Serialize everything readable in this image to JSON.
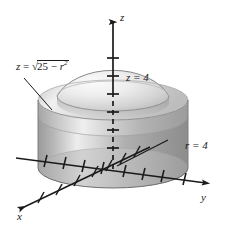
{
  "figure": {
    "background_color": "#ffffff",
    "ink_color": "#1a1a1a",
    "width": 227,
    "height": 231
  },
  "axes": {
    "z": {
      "label": "z",
      "direction": "up",
      "arrow": true
    },
    "y": {
      "label": "y",
      "direction": "right",
      "arrow": true
    },
    "x": {
      "label": "x",
      "direction": "down-left",
      "arrow": true
    },
    "tick_marks": true
  },
  "annotations": {
    "surface": {
      "name": "sphere-equation",
      "prefix": "z",
      "equals": "=",
      "radical_sign": "√",
      "radicand_lead": "25",
      "minus": "−",
      "radicand_var": "r",
      "radicand_exp": "2",
      "plain_text": "z = √(25 − r²)"
    },
    "plane": {
      "name": "plane-equation",
      "text": "z = 4"
    },
    "cylinder": {
      "name": "cylinder-equation",
      "text": "r = 4"
    }
  },
  "solid": {
    "description": "Shaded gray solid: circular cylinder of radius 4 capped by a spherical dome",
    "cylinder_fill_light": "#e8e8e8",
    "cylinder_fill_mid": "#b4b4b4",
    "cylinder_fill_dark": "#8e8e8e",
    "cap_fill_light": "#f2f2f2",
    "cap_fill_mid": "#d2d2d2",
    "outline_color": "#6a6a6a"
  }
}
